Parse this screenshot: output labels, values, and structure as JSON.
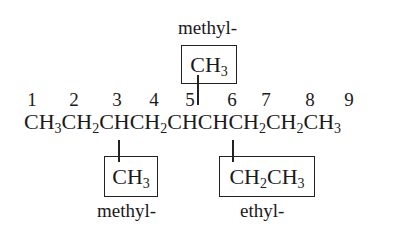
{
  "diagram": {
    "main_chain": {
      "groups": [
        {
          "base": "CH",
          "sub": "3"
        },
        {
          "base": "CH",
          "sub": "2"
        },
        {
          "base": "CH",
          "sub": ""
        },
        {
          "base": "CH",
          "sub": "2"
        },
        {
          "base": "CH",
          "sub": ""
        },
        {
          "base": "CH",
          "sub": ""
        },
        {
          "base": "CH",
          "sub": "2"
        },
        {
          "base": "CH",
          "sub": "2"
        },
        {
          "base": "CH",
          "sub": "3"
        }
      ],
      "carbon_numbers": [
        "1",
        "2",
        "3",
        "4",
        "5",
        "6",
        "7",
        "8",
        "9"
      ]
    },
    "substituents": [
      {
        "position": "top",
        "attached_to_carbon": "5",
        "formula_parts": [
          {
            "base": "CH",
            "sub": "3"
          }
        ],
        "name": "methyl-"
      },
      {
        "position": "bottom",
        "attached_to_carbon": "3",
        "formula_parts": [
          {
            "base": "CH",
            "sub": "3"
          }
        ],
        "name": "methyl-"
      },
      {
        "position": "bottom",
        "attached_to_carbon": "6",
        "formula_parts": [
          {
            "base": "CH",
            "sub": "2"
          },
          {
            "base": "CH",
            "sub": "3"
          }
        ],
        "name": "ethyl-"
      }
    ]
  }
}
